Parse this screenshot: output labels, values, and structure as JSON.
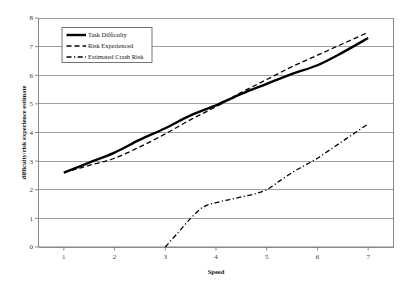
{
  "chart_data": {
    "type": "line",
    "title": "",
    "subtitle": "",
    "xlabel": "Speed",
    "ylabel": "difficulty/risk experience estimate",
    "xlim": [
      0.5,
      7.5
    ],
    "ylim": [
      0,
      8
    ],
    "x_ticks": [
      "1",
      "2",
      "3",
      "4",
      "5",
      "6",
      "7"
    ],
    "x_tick_values": [
      1,
      2,
      3,
      4,
      5,
      6,
      7
    ],
    "y_ticks": [
      "0",
      "1",
      "2",
      "3",
      "4",
      "5",
      "6",
      "7",
      "8"
    ],
    "y_tick_values": [
      0,
      1,
      2,
      3,
      4,
      5,
      6,
      7,
      8
    ],
    "grid": "horizontal",
    "legend_position": "upper-left-inside",
    "series": [
      {
        "name": "Task Difficulty",
        "style": "solid",
        "width": 2.4,
        "color": "#000000",
        "x": [
          1,
          1.5,
          2,
          2.5,
          3,
          3.5,
          4,
          4.5,
          5,
          5.5,
          6,
          6.5,
          7
        ],
        "values": [
          2.6,
          2.95,
          3.3,
          3.75,
          4.15,
          4.6,
          4.95,
          5.35,
          5.7,
          6.05,
          6.35,
          6.8,
          7.3
        ]
      },
      {
        "name": "Risk Experienced",
        "style": "dashed",
        "width": 1.3,
        "color": "#000000",
        "x": [
          1,
          1.5,
          2,
          2.5,
          3,
          3.5,
          4,
          4.5,
          5,
          5.5,
          6,
          6.5,
          7
        ],
        "values": [
          2.6,
          2.85,
          3.1,
          3.5,
          3.95,
          4.45,
          4.9,
          5.4,
          5.85,
          6.3,
          6.7,
          7.1,
          7.5
        ]
      },
      {
        "name": "Estimated Crash Risk",
        "style": "dash-dot",
        "width": 1.3,
        "color": "#000000",
        "x": [
          3,
          3.25,
          3.5,
          3.75,
          4,
          4.25,
          4.5,
          4.75,
          5,
          5.25,
          5.5,
          5.75,
          6,
          6.25,
          6.5,
          6.75,
          7
        ],
        "values": [
          0,
          0.5,
          1.0,
          1.4,
          1.55,
          1.65,
          1.75,
          1.85,
          2.0,
          2.3,
          2.6,
          2.85,
          3.1,
          3.4,
          3.7,
          4.0,
          4.3
        ]
      }
    ]
  },
  "legend": {
    "items": [
      {
        "label": "Task Difficulty"
      },
      {
        "label": "Risk Experienced"
      },
      {
        "label": "Estimated Crash Risk"
      }
    ]
  }
}
